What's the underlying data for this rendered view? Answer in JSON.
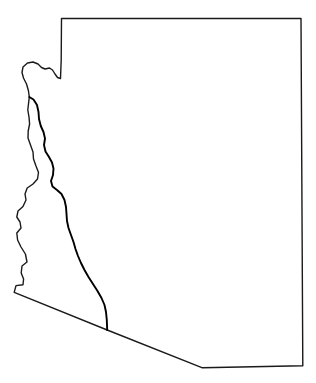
{
  "figure": {
    "kind": "map",
    "title": "",
    "caption": "",
    "background_color": "#ffffff",
    "width": 316,
    "height": 383
  },
  "style": {
    "outline_color": "#1a1a1a",
    "outline_width": 1.4,
    "region_border_color": "#000000",
    "region_border_width": 1.9,
    "stipple_dot_color": "#9a9a9a",
    "stipple_background": "#fbfbfb",
    "stipple_spacing": 3
  },
  "layers": [
    {
      "name": "state-boundary",
      "label": "Arizona state boundary",
      "stroke": "#1a1a1a",
      "filled": false
    },
    {
      "name": "highlighted-region",
      "label": "Stippled western corridor region",
      "stroke": "#000000",
      "filled": true,
      "fill_style": "stipple"
    }
  ],
  "geometry": {
    "state_outline_path": "M 61.5 18.5 L 301.0 18.5 L 302.8 365.8 L 202.5 367.8 L 107.2 330.0 L 14.2 292.4 L 16.0 285.6 L 23.0 284.8 L 23.6 279.0 L 21.2 273.0 L 22.0 266.0 L 27.0 262.0 L 25.4 254.0 L 21.0 247.0 L 17.6 240.0 L 16.8 233.0 L 21.0 228.0 L 20.0 222.0 L 16.8 217.0 L 18.0 211.0 L 23.0 206.5 L 26.0 200.0 L 25.0 194.0 L 27.2 188.0 L 33.0 184.0 L 37.5 179.0 L 38.5 172.5 L 36.0 166.0 L 33.5 159.0 L 33.0 152.0 L 30.5 145.0 L 28.0 138.0 L 28.2 131.0 L 29.6 124.0 L 29.0 117.0 L 27.8 110.0 L 28.6 103.0 L 29.3 97.0 L 28.4 90.5 L 26.5 84.0 L 23.5 78.0 L 22.0 72.5 L 23.0 67.0 L 27.5 63.0 L 33.0 62.0 L 38.0 64.0 L 41.5 67.5 L 45.0 69.0 L 49.5 68.0 L 52.5 70.0 L 55.0 74.0 L 57.5 77.5 L 60.5 78.5 L 61.2 60.0 Z",
    "region_path": "M 29.3 97.0 L 33.5 99.5 L 37.0 105.0 L 38.5 112.0 L 39.0 119.0 L 40.8 126.0 L 43.5 132.0 L 45.0 138.5 L 44.0 145.0 L 45.5 151.5 L 49.0 157.0 L 52.0 162.5 L 53.5 168.5 L 53.0 175.0 L 51.0 181.0 L 52.5 186.5 L 57.0 190.0 L 61.5 194.0 L 64.5 200.0 L 66.0 207.0 L 66.5 214.0 L 67.0 221.0 L 68.5 228.0 L 71.0 235.0 L 73.5 242.0 L 75.5 249.0 L 78.0 256.0 L 81.0 263.0 L 84.5 270.0 L 88.5 277.0 L 93.0 284.0 L 97.5 291.0 L 101.5 298.0 L 104.5 305.0 L 106.0 312.0 L 106.8 320.0 L 107.2 330.0 L 14.2 292.4 L 16.0 285.6 L 23.0 284.8 L 23.6 279.0 L 21.2 273.0 L 22.0 266.0 L 27.0 262.0 L 25.4 254.0 L 21.0 247.0 L 17.6 240.0 L 16.8 233.0 L 21.0 228.0 L 20.0 222.0 L 16.8 217.0 L 18.0 211.0 L 23.0 206.5 L 26.0 200.0 L 25.0 194.0 L 27.2 188.0 L 33.0 184.0 L 37.5 179.0 L 38.5 172.5 L 36.0 166.0 L 33.5 159.0 L 33.0 152.0 L 30.5 145.0 L 28.0 138.0 L 28.2 131.0 L 29.6 124.0 L 29.0 117.0 L 27.8 110.0 L 28.6 103.0 Z"
  },
  "vertices": {
    "northwest_corner": [
      61.5,
      18.5
    ],
    "northeast_corner": [
      301.0,
      18.5
    ],
    "southeast_corner": [
      302.8,
      365.8
    ],
    "south_bend": [
      202.5,
      367.8
    ],
    "region_south_tip": [
      107.2,
      330.0
    ],
    "southwest_corner": [
      14.2,
      292.4
    ],
    "region_north_tip": [
      29.3,
      97.0
    ]
  },
  "labels": [],
  "legend": {
    "visible": false,
    "entries": []
  }
}
